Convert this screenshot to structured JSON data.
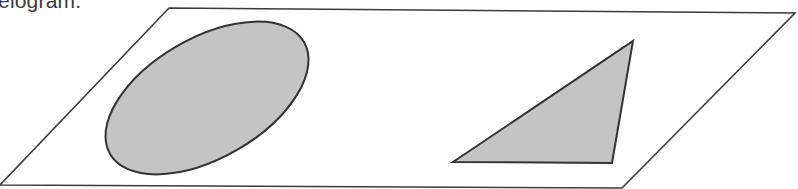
{
  "caption": {
    "text": "elogram."
  },
  "figure": {
    "width": 798,
    "height": 189,
    "parallelogram": {
      "points": "169,8 795,13 622,188 0,185",
      "stroke": "#3c3c3c",
      "fill": "none"
    },
    "ellipse": {
      "cx": 207,
      "cy": 98,
      "rx": 112,
      "ry": 60,
      "rotation": -30,
      "fill": "#c4c4c4",
      "stroke": "#333333"
    },
    "triangle": {
      "points": "453,162 633,41 612,163",
      "fill": "#c4c4c4",
      "stroke": "#333333"
    }
  }
}
